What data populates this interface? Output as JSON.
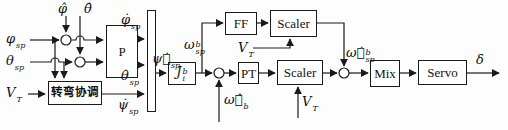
{
  "diagram": {
    "blocks": {
      "p": "P",
      "turn_coord": "转弯协调",
      "j": {
        "base": "J",
        "sup": "b",
        "sub": "i"
      },
      "ff": "FF",
      "scaler_ff": "Scaler",
      "pt": "PT",
      "scaler_pt": "Scaler",
      "mix": "Mix",
      "servo": "Servo"
    },
    "labels": {
      "phi_sp": {
        "base": "φ",
        "sup": "",
        "sub": "sp"
      },
      "theta_sp": {
        "base": "θ",
        "sup": "",
        "sub": "sp"
      },
      "v_t_left": {
        "base": "V",
        "sup": "",
        "sub": "T"
      },
      "phi_hat": {
        "base": "φ̂",
        "sup": "",
        "sub": ""
      },
      "theta_hat": {
        "base": "θ̂",
        "sup": "",
        "sub": ""
      },
      "phi_dot_sp": {
        "base": "φ̇",
        "sup": "",
        "sub": "sp"
      },
      "theta_dot_sp": {
        "base": "θ̇",
        "sup": "",
        "sub": "sp"
      },
      "psi_dot_sp": {
        "base": "ψ̇",
        "sup": "",
        "sub": "sp"
      },
      "psi_dot_vec_sp": {
        "base": "ψ⃗̇",
        "sup": "",
        "sub": "sp"
      },
      "omega_sp_b": {
        "base": "ω",
        "sup": "b",
        "sub": "sp"
      },
      "omega_hat_vec_b": {
        "base": "ω⃗̂",
        "sup": "b",
        "sub": ""
      },
      "v_t_ff": {
        "base": "V",
        "sup": "",
        "sub": "T"
      },
      "v_t_pt": {
        "base": "V",
        "sup": "",
        "sub": "T"
      },
      "omega_dot_vec_sp_b": {
        "base": "ω⃗̇",
        "sup": "b",
        "sub": "sp"
      },
      "delta": {
        "base": "δ",
        "sup": "",
        "sub": ""
      }
    },
    "colors": {
      "line": "#1a1a1a",
      "block_bg": "#ffffff",
      "bg": "#fdfdfd"
    }
  }
}
